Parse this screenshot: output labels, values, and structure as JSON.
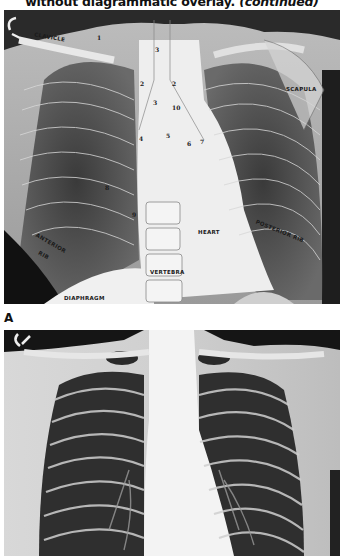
{
  "caption": {
    "text": "without diagrammatic overlay.",
    "continued": "(continued)"
  },
  "figureA": {
    "panel_label": "A",
    "labels": {
      "clavicle": "CLAVICLE",
      "scapula": "SCAPULA",
      "anterior_rib_1": "ANTERIOR",
      "anterior_rib_2": "RIB",
      "posterior_rib": "POSTERIOR RIB",
      "heart": "HEART",
      "vertebra": "VERTEBRA",
      "diaphragm": "DIAPHRAGM"
    },
    "numbers": [
      "1",
      "2",
      "2",
      "3",
      "3",
      "10",
      "4",
      "5",
      "6",
      "7",
      "8",
      "9"
    ]
  },
  "figureB": {
    "description": "Chest radiograph without overlay"
  }
}
